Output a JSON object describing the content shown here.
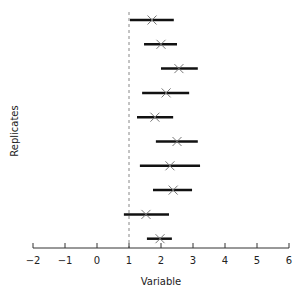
{
  "chart_data": {
    "type": "scatter",
    "subtype": "forest-plot",
    "title": "",
    "xlabel": "Variable",
    "ylabel": "Replicates",
    "xlim": [
      -2,
      6
    ],
    "xticks": [
      -2,
      -1,
      0,
      1,
      2,
      3,
      4,
      5,
      6
    ],
    "xtick_labels": [
      "−2",
      "−1",
      "0",
      "1",
      "2",
      "3",
      "4",
      "5",
      "6"
    ],
    "reference_line": {
      "x": 1,
      "style": "dashed",
      "color": "#888888"
    },
    "grid": false,
    "legend": null,
    "marker": "x",
    "series": [
      {
        "name": "Replicate 1",
        "mean": 1.72,
        "low": 1.03,
        "high": 2.4
      },
      {
        "name": "Replicate 2",
        "mean": 2.0,
        "low": 1.47,
        "high": 2.5
      },
      {
        "name": "Replicate 3",
        "mean": 2.56,
        "low": 2.0,
        "high": 3.15
      },
      {
        "name": "Replicate 4",
        "mean": 2.16,
        "low": 1.41,
        "high": 2.88
      },
      {
        "name": "Replicate 5",
        "mean": 1.81,
        "low": 1.25,
        "high": 2.38
      },
      {
        "name": "Replicate 6",
        "mean": 2.5,
        "low": 1.84,
        "high": 3.15
      },
      {
        "name": "Replicate 7",
        "mean": 2.28,
        "low": 1.34,
        "high": 3.22
      },
      {
        "name": "Replicate 8",
        "mean": 2.38,
        "low": 1.75,
        "high": 2.97
      },
      {
        "name": "Replicate 9",
        "mean": 1.53,
        "low": 0.84,
        "high": 2.25
      },
      {
        "name": "Replicate 10",
        "mean": 1.97,
        "low": 1.56,
        "high": 2.34
      }
    ],
    "colors": {
      "interval": "#111111",
      "marker": "#777777",
      "axis": "#333333"
    }
  },
  "axis": {
    "x_label": "Variable",
    "y_label": "Replicates"
  }
}
